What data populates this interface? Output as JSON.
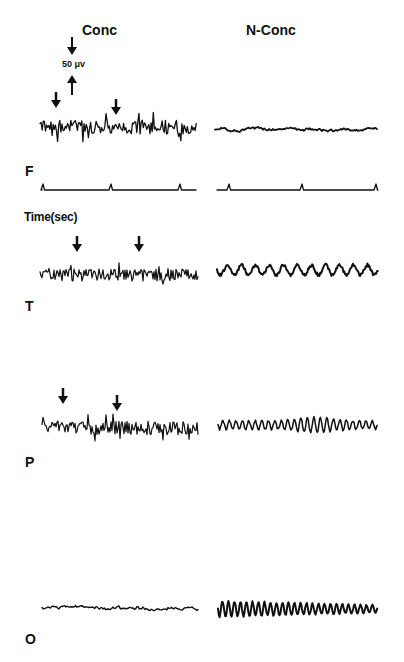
{
  "figure": {
    "columns": [
      {
        "id": "conc",
        "label": "Conc"
      },
      {
        "id": "nconc",
        "label": "N-Conc"
      }
    ],
    "scale_bar": {
      "label": "50 μv"
    },
    "time_axis": {
      "label": "Time(sec)"
    },
    "channels": [
      {
        "id": "F",
        "label": "F"
      },
      {
        "id": "T",
        "label": "T"
      },
      {
        "id": "P",
        "label": "P"
      },
      {
        "id": "O",
        "label": "O"
      }
    ],
    "colors": {
      "ink": "#111111",
      "background": "#ffffff"
    }
  },
  "chart_data": {
    "type": "line",
    "xlabel": "Time(sec)",
    "ylabel": "",
    "scale_bar": "50 μv",
    "legend_position": "top (column headers)",
    "grid": false,
    "panels": [
      {
        "channel": "F",
        "condition": "Conc",
        "description": "high-amplitude fast activity with spikes",
        "arrows": 2,
        "amplitude": "high",
        "frequency": "fast"
      },
      {
        "channel": "F",
        "condition": "N-Conc",
        "description": "low-amplitude irregular activity",
        "arrows": 0,
        "amplitude": "low",
        "frequency": "slow-irregular"
      },
      {
        "channel": "Time",
        "condition": "Conc",
        "description": "time marker pulses",
        "markers": 3
      },
      {
        "channel": "Time",
        "condition": "N-Conc",
        "description": "time marker pulses",
        "markers": 3
      },
      {
        "channel": "T",
        "condition": "Conc",
        "description": "fast low-voltage activity",
        "arrows": 2,
        "amplitude": "medium",
        "frequency": "fast"
      },
      {
        "channel": "T",
        "condition": "N-Conc",
        "description": "slow irregular waves",
        "arrows": 0,
        "amplitude": "medium",
        "frequency": "slow"
      },
      {
        "channel": "P",
        "condition": "Conc",
        "description": "fast activity with spikes",
        "arrows": 2,
        "amplitude": "medium",
        "frequency": "fast"
      },
      {
        "channel": "P",
        "condition": "N-Conc",
        "description": "alpha-like rhythmic waves with burst",
        "arrows": 0,
        "amplitude": "medium-high",
        "frequency": "alpha"
      },
      {
        "channel": "O",
        "condition": "Conc",
        "description": "low-amplitude irregular activity",
        "arrows": 0,
        "amplitude": "low",
        "frequency": "mixed"
      },
      {
        "channel": "O",
        "condition": "N-Conc",
        "description": "prominent rhythmic alpha waves",
        "arrows": 0,
        "amplitude": "high",
        "frequency": "alpha"
      }
    ]
  }
}
